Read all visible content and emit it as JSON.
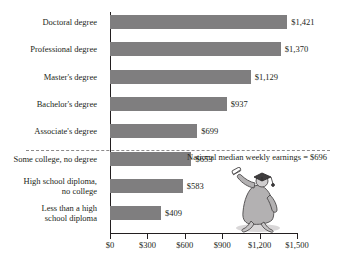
{
  "chart_data": {
    "type": "bar",
    "orientation": "horizontal",
    "title": "",
    "xlabel": "",
    "ylabel": "",
    "xlim": [
      0,
      1500
    ],
    "grid": false,
    "legend": "none",
    "categories": [
      "Doctoral degree",
      "Professional degree",
      "Master's degree",
      "Bachelor's degree",
      "Associate's degree",
      "Some college, no degree",
      "High school diploma,\nno college",
      "Less than a high\nschool diploma"
    ],
    "values": [
      1421,
      1370,
      1129,
      937,
      699,
      653,
      583,
      409
    ],
    "value_labels": [
      "$1,421",
      "$1,370",
      "$1,129",
      "$937",
      "$699",
      "$653",
      "$583",
      "$409"
    ],
    "tick_values": [
      0,
      300,
      600,
      900,
      1200,
      1500
    ],
    "tick_labels": [
      "$0",
      "$300",
      "$600",
      "$900",
      "$1,200",
      "$1,500"
    ],
    "annotations": [
      {
        "name": "national-median-reference",
        "text": "National median weekly earnings = $696",
        "value": 696,
        "style": "dashed-line"
      }
    ],
    "colors": {
      "bar": "#7f7e7f",
      "axis": "#231f20",
      "text": "#231f20",
      "dashed_line": "#8c8a8b",
      "background": "#ffffff"
    },
    "illustration": "graduate-in-cap-and-gown-holding-diploma"
  }
}
